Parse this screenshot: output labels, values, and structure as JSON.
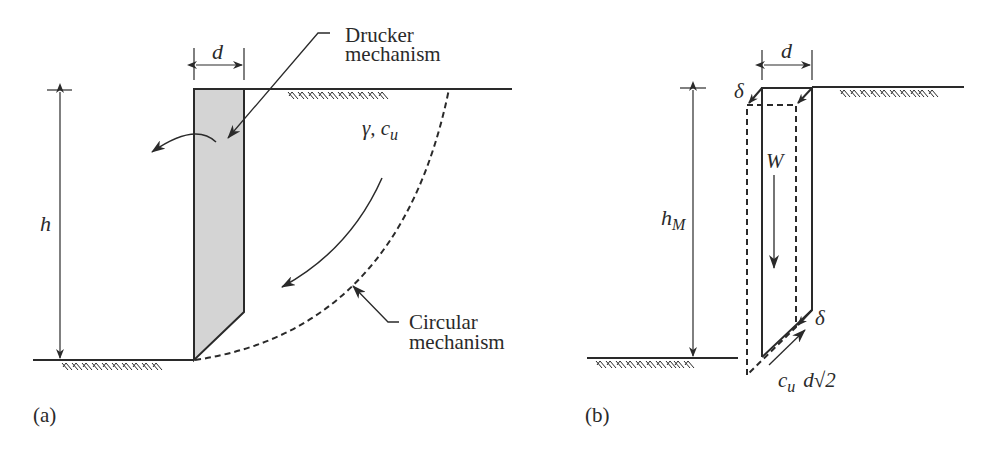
{
  "colors": {
    "ink": "#2a2a2a",
    "shade": "#d4d4d4",
    "background": "#ffffff"
  },
  "panel_a": {
    "caption": "(a)",
    "width_label": "d",
    "height_label": "h",
    "soil_label": "γ, c",
    "soil_label_sub": "u",
    "drucker_label_line1": "Drucker",
    "drucker_label_line2": "mechanism",
    "circular_label_line1": "Circular",
    "circular_label_line2": "mechanism"
  },
  "panel_b": {
    "caption": "(b)",
    "width_label": "d",
    "height_label": "h",
    "height_label_sub": "M",
    "weight_label": "W",
    "displacement_top": "δ",
    "displacement_bottom": "δ",
    "shear_label": "c",
    "shear_label_sub": "u",
    "shear_length": "d√2"
  }
}
